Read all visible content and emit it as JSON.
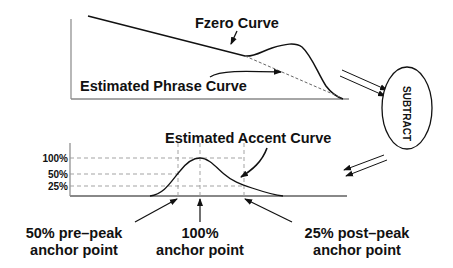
{
  "top_chart": {
    "fzero_label": "Fzero Curve",
    "phrase_label": "Estimated Phrase Curve"
  },
  "subtract": {
    "label": "SUBTRACT"
  },
  "bottom_chart": {
    "accent_label": "Estimated Accent Curve",
    "y_ticks": [
      "100%",
      "50%",
      "25%"
    ],
    "anchors": [
      {
        "line1": "50% pre–peak",
        "line2": "anchor point"
      },
      {
        "line1": "100%",
        "line2": "anchor point"
      },
      {
        "line1": "25% post–peak",
        "line2": "anchor point"
      }
    ]
  },
  "colors": {
    "ink": "#111111",
    "axis": "#888888",
    "dash": "#999999"
  }
}
